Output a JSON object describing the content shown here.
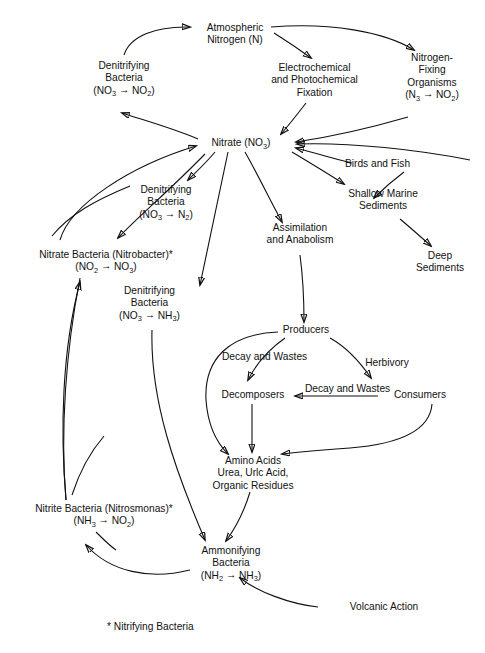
{
  "diagram": {
    "footnote": "* Nitrifying Bacteria",
    "nodes": {
      "atmospheric_nitrogen": {
        "line1": "Atmospheric",
        "line2": "Nitrogen (N)"
      },
      "denitrifying_bacteria_top": {
        "line1": "Denitrifying",
        "line2": "Bacteria",
        "formula_left": "(NO",
        "formula_left_sub": "3",
        "formula_arrow": "→",
        "formula_right": "NO",
        "formula_right_sub": "2",
        "formula_close": ")"
      },
      "electrochemical_fixation": {
        "line1": "Electrochemical",
        "line2": "and Photochemical",
        "line3": "Fixation"
      },
      "nitrogen_fixing_organisms": {
        "line1": "Nitrogen-",
        "line2": "Fixing",
        "line3": "Organisms",
        "formula_left": "(N",
        "formula_left_sub": "3",
        "formula_arrow": "→",
        "formula_right": "NO",
        "formula_right_sub": "2",
        "formula_close": ")"
      },
      "nitrate": {
        "text_left": "Nitrate (NO",
        "text_sub": "3",
        "text_right": ")"
      },
      "birds_and_fish": {
        "line1": "Birds and Fish"
      },
      "shallow_marine_sediments": {
        "line1": "Shallow Marine",
        "line2": "Sediments"
      },
      "deep_sediments": {
        "line1": "Deep",
        "line2": "Sediments"
      },
      "denitrifying_bacteria_n2": {
        "line1": "Denitrifying",
        "line2": "Bacteria",
        "formula_left": "(NO",
        "formula_left_sub": "3",
        "formula_arrow": "→",
        "formula_right": "N",
        "formula_right_sub": "2",
        "formula_close": ")"
      },
      "assimilation": {
        "line1": "Assimilation",
        "line2": "and Anabolism"
      },
      "nitrate_bacteria": {
        "line1": "Nitrate Bacteria (Nitrobacter)*",
        "formula_left": "(NO",
        "formula_left_sub": "2",
        "formula_arrow": "→",
        "formula_right": "NO",
        "formula_right_sub": "3",
        "formula_close": ")"
      },
      "denitrifying_bacteria_nh3": {
        "line1": "Denitrifying",
        "line2": "Bacteria",
        "formula_left": "(NO",
        "formula_left_sub": "3",
        "formula_arrow": "→",
        "formula_right": "NH",
        "formula_right_sub": "3",
        "formula_close": ")"
      },
      "producers": {
        "line1": "Producers"
      },
      "herbivory": {
        "line1": "Herbivory"
      },
      "decay_and_wastes_left": {
        "line1": "Decay and",
        "line2": "Wastes"
      },
      "decay_and_wastes_mid": {
        "line1": "Decay and",
        "line2": "Wastes"
      },
      "decomposers": {
        "line1": "Decomposers"
      },
      "consumers": {
        "line1": "Consumers"
      },
      "amino_acids": {
        "line1": "Amino Acids",
        "line2": "Urea, Urlc Acid,",
        "line3": "Organic Residues"
      },
      "nitrite_bacteria": {
        "line1": "Nitrite Bacteria (Nitrosmonas)*",
        "formula_left": "(NH",
        "formula_left_sub": "3",
        "formula_arrow": "→",
        "formula_right": "NO",
        "formula_right_sub": "2",
        "formula_close": ")"
      },
      "ammonifying_bacteria": {
        "line1": "Ammonifying",
        "line2": "Bacteria",
        "formula_left": "(NH",
        "formula_left_sub": "2",
        "formula_arrow": "→",
        "formula_right": "NH",
        "formula_right_sub": "3",
        "formula_close": ")"
      },
      "volcanic_action": {
        "line1": "Volcanic Action"
      }
    },
    "colors": {
      "ink": "#111111",
      "background": "#ffffff"
    }
  }
}
